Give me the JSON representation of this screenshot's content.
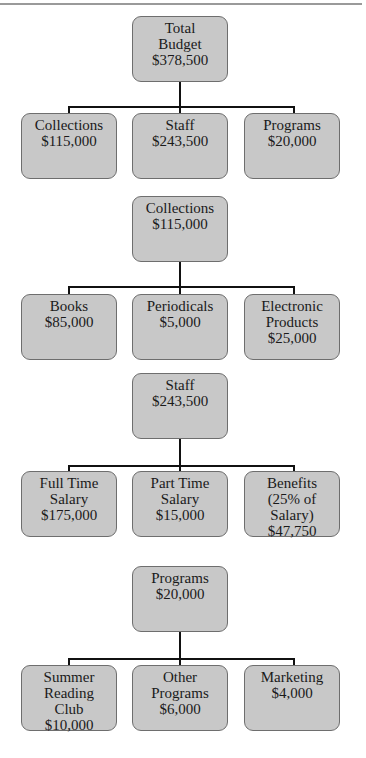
{
  "diagram": {
    "type": "org-chart",
    "trees": [
      {
        "parent": {
          "lines": [
            "Total",
            "Budget",
            "$378,500"
          ]
        },
        "children": [
          {
            "lines": [
              "Collections",
              "$115,000"
            ]
          },
          {
            "lines": [
              "Staff",
              "$243,500"
            ]
          },
          {
            "lines": [
              "Programs",
              "$20,000"
            ]
          }
        ]
      },
      {
        "parent": {
          "lines": [
            "Collections",
            "$115,000"
          ]
        },
        "children": [
          {
            "lines": [
              "Books",
              "$85,000"
            ]
          },
          {
            "lines": [
              "Periodicals",
              "$5,000"
            ]
          },
          {
            "lines": [
              "Electronic",
              "Products",
              "$25,000"
            ]
          }
        ]
      },
      {
        "parent": {
          "lines": [
            "Staff",
            "$243,500"
          ]
        },
        "children": [
          {
            "lines": [
              "Full Time",
              "Salary",
              "$175,000"
            ]
          },
          {
            "lines": [
              "Part Time",
              "Salary",
              "$15,000"
            ]
          },
          {
            "lines": [
              "Benefits",
              "(25% of Salary)",
              "$47,750"
            ]
          }
        ]
      },
      {
        "parent": {
          "lines": [
            "Programs",
            "$20,000"
          ]
        },
        "children": [
          {
            "lines": [
              "Summer",
              "Reading",
              "Club",
              "$10,000"
            ]
          },
          {
            "lines": [
              "Other",
              "Programs",
              "$6,000"
            ]
          },
          {
            "lines": [
              "Marketing",
              "$4,000"
            ]
          }
        ]
      }
    ]
  },
  "colors": {
    "box_fill": "#c8c8c8",
    "box_border": "#6e6e6e",
    "connector": "#111111",
    "top_rule": "#9a9a9a"
  }
}
